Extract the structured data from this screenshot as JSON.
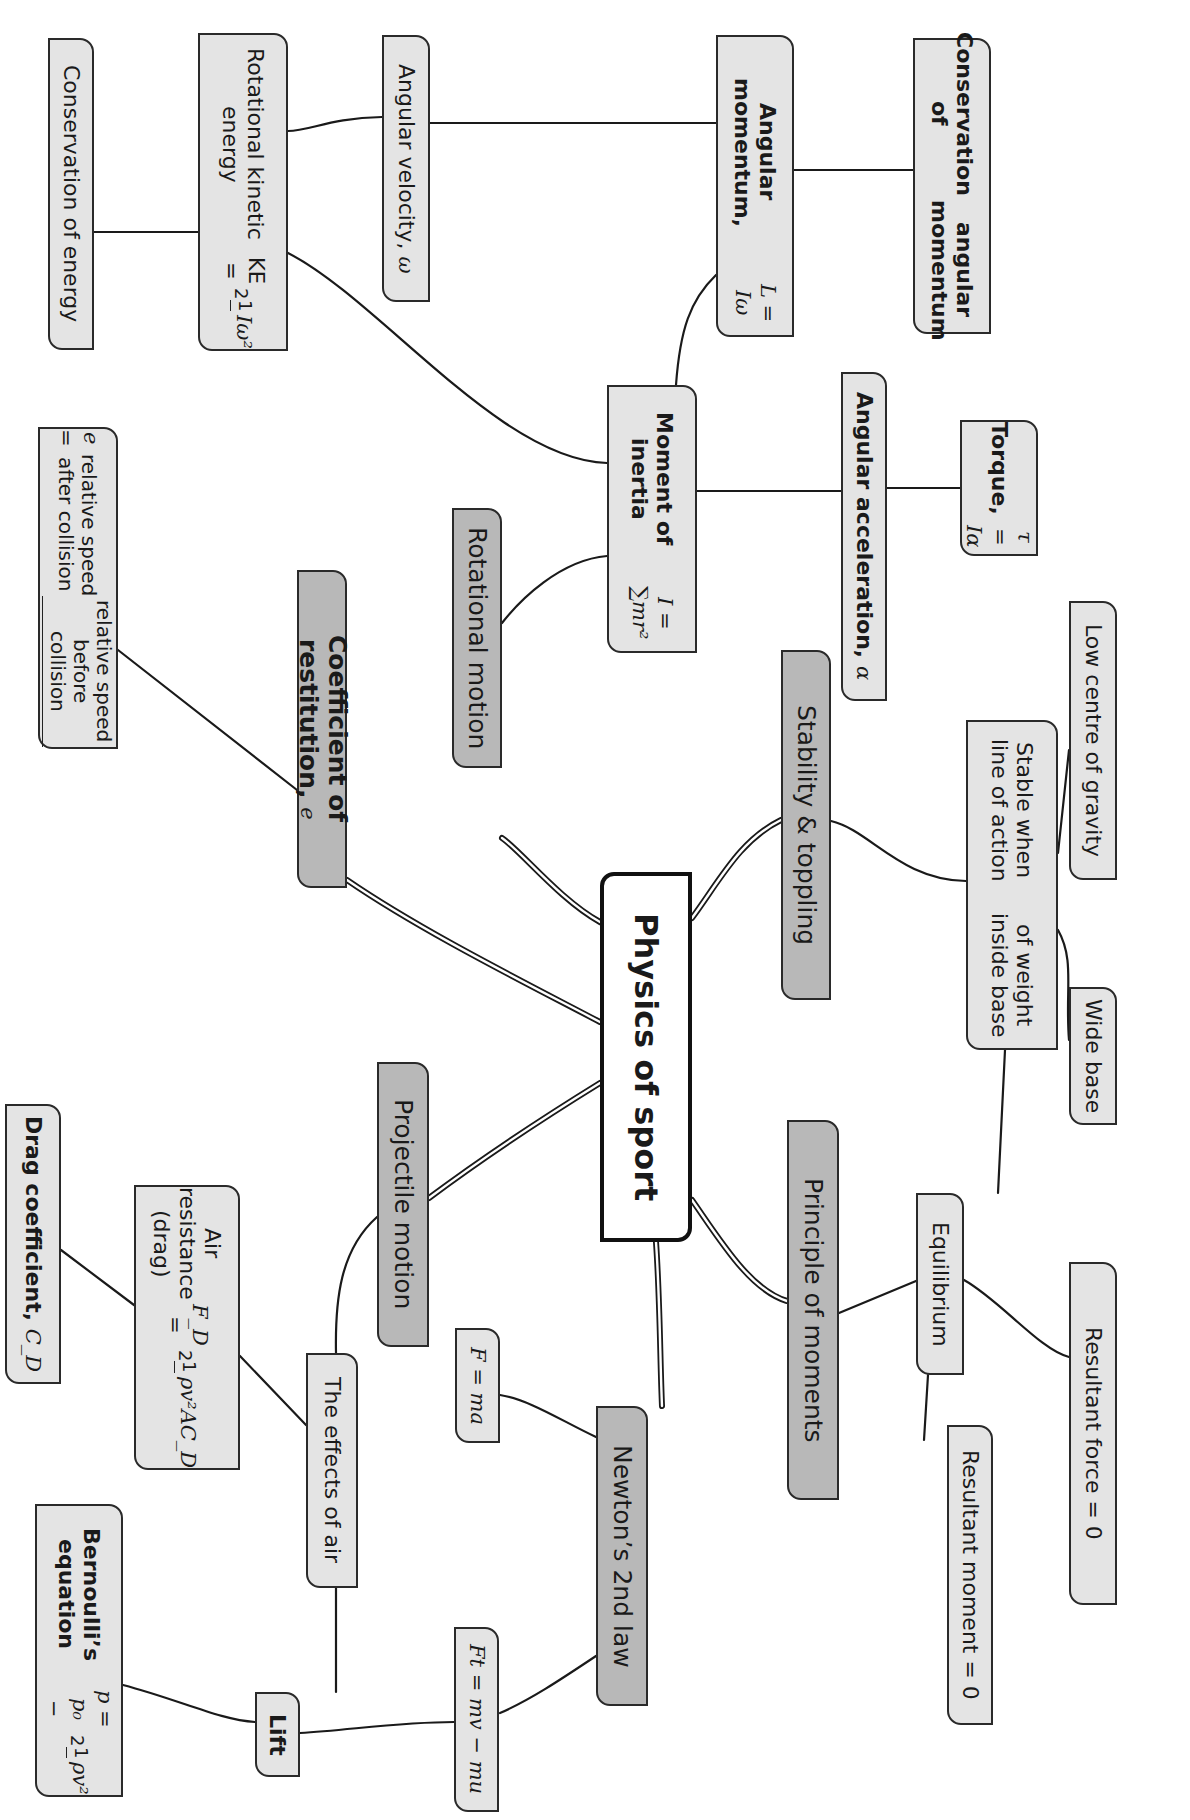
{
  "diagram": {
    "type": "mind-map",
    "orientation": "rotated-90-clockwise",
    "colors": {
      "root_fill": "#ffffff",
      "branch_fill": "#b8b8b8",
      "leaf_fill": "#e4e4e4",
      "border": "#2a2a2a",
      "line": "#1a1a1a",
      "background": "#ffffff"
    },
    "root": {
      "label": "Physics of sport"
    },
    "branches": [
      {
        "id": "rotational-motion",
        "label": "Rotational motion"
      },
      {
        "id": "coefficient-of-restitution",
        "label": "Coefficient of restitution,",
        "symbol": "e"
      },
      {
        "id": "stability-toppling",
        "label": "Stability & toppling"
      },
      {
        "id": "projectile-motion",
        "label": "Projectile motion"
      },
      {
        "id": "principle-of-moments",
        "label": "Principle of moments"
      },
      {
        "id": "newtons-2nd-law",
        "label": "Newton’s 2nd law"
      }
    ],
    "nodes": {
      "conservation_of_energy": {
        "label": "Conservation of energy"
      },
      "rotational_ke": {
        "label": "Rotational kinetic energy",
        "formula_lhs": "KE =",
        "frac_num": "1",
        "frac_den": "2",
        "formula_rhs": "Iω²"
      },
      "angular_velocity": {
        "label": "Angular velocity,",
        "symbol": "ω"
      },
      "angular_momentum": {
        "label": "Angular momentum,",
        "formula": "L = Iω"
      },
      "conservation_angular_momentum": {
        "line1": "Conservation of",
        "line2": "angular momentum"
      },
      "moment_of_inertia": {
        "label": "Moment of inertia",
        "formula": "I = ∑mr²"
      },
      "angular_acceleration": {
        "label": "Angular acceleration,",
        "symbol": "α"
      },
      "torque": {
        "label": "Torque,",
        "formula": "τ = Iα"
      },
      "restitution_formula": {
        "lhs": "e =",
        "numerator": "relative speed before collision",
        "denominator": "relative speed after collision"
      },
      "low_centre_of_gravity": {
        "label": "Low centre of gravity"
      },
      "stable_when": {
        "line1": "Stable when line of action",
        "line2": "of weight inside base"
      },
      "wide_base": {
        "label": "Wide base"
      },
      "equilibrium": {
        "label": "Equilibrium"
      },
      "resultant_force": {
        "label": "Resultant force = 0"
      },
      "resultant_moment": {
        "label": "Resultant moment = 0"
      },
      "effects_of_air": {
        "label": "The effects of air"
      },
      "air_resistance": {
        "label": "Air resistance (drag)",
        "formula_lhs": "F_D =",
        "frac_num": "1",
        "frac_den": "2",
        "formula_rhs": "ρv²AC_D"
      },
      "drag_coefficient": {
        "label": "Drag coefficient,",
        "symbol": "C_D"
      },
      "f_ma": {
        "formula": "F = ma"
      },
      "impulse": {
        "formula": "Ft = mv − mu"
      },
      "lift": {
        "label": "Lift"
      },
      "bernoulli": {
        "label": "Bernoulli’s equation",
        "formula_lhs": "p = p₀ −",
        "frac_num": "1",
        "frac_den": "2",
        "formula_rhs": "ρv²"
      }
    },
    "edges": [
      [
        "Physics of sport",
        "Rotational motion"
      ],
      [
        "Physics of sport",
        "Coefficient of restitution"
      ],
      [
        "Physics of sport",
        "Stability & toppling"
      ],
      [
        "Physics of sport",
        "Projectile motion"
      ],
      [
        "Physics of sport",
        "Principle of moments"
      ],
      [
        "Physics of sport",
        "Newton’s 2nd law"
      ],
      [
        "Rotational motion",
        "Moment of inertia"
      ],
      [
        "Moment of inertia",
        "Angular momentum"
      ],
      [
        "Moment of inertia",
        "Rotational kinetic energy"
      ],
      [
        "Moment of inertia",
        "Angular acceleration"
      ],
      [
        "Angular acceleration",
        "Torque"
      ],
      [
        "Angular momentum",
        "Angular velocity"
      ],
      [
        "Angular momentum",
        "Conservation of angular momentum"
      ],
      [
        "Rotational kinetic energy",
        "Angular velocity"
      ],
      [
        "Rotational kinetic energy",
        "Conservation of energy"
      ],
      [
        "Coefficient of restitution",
        "e formula"
      ],
      [
        "Stability & toppling",
        "Stable when line of action of weight inside base"
      ],
      [
        "Stable when line of action of weight inside base",
        "Low centre of gravity"
      ],
      [
        "Stable when line of action of weight inside base",
        "Wide base"
      ],
      [
        "Stable when line of action of weight inside base",
        "Equilibrium"
      ],
      [
        "Principle of moments",
        "Equilibrium"
      ],
      [
        "Equilibrium",
        "Resultant force = 0"
      ],
      [
        "Equilibrium",
        "Resultant moment = 0"
      ],
      [
        "Projectile motion",
        "The effects of air"
      ],
      [
        "The effects of air",
        "Air resistance (drag)"
      ],
      [
        "Air resistance (drag)",
        "Drag coefficient"
      ],
      [
        "The effects of air",
        "Lift"
      ],
      [
        "Lift",
        "Bernoulli’s equation"
      ],
      [
        "Lift",
        "Ft = mv − mu"
      ],
      [
        "Newton’s 2nd law",
        "F = ma"
      ],
      [
        "Newton’s 2nd law",
        "Ft = mv − mu"
      ]
    ]
  }
}
